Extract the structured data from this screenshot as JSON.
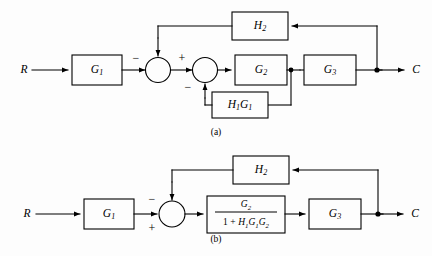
{
  "figure": {
    "type": "control-system-block-diagram",
    "background_color": "#fdfdfd",
    "line_color": "#000000",
    "captions": {
      "a": "(a)",
      "b": "(b)"
    }
  },
  "diagram_a": {
    "caption": "(a)",
    "input_label": "R",
    "output_label": "C",
    "blocks": [
      {
        "name": "G1",
        "base": "G",
        "sub": "1"
      },
      {
        "name": "G2",
        "base": "G",
        "sub": "2"
      },
      {
        "name": "G3",
        "base": "G",
        "sub": "3"
      },
      {
        "name": "H2",
        "base": "H",
        "sub": "2"
      },
      {
        "name": "H1G1",
        "base": "H",
        "sub": "1",
        "base2": "G",
        "sub2": "1"
      }
    ],
    "summing_junctions": [
      {
        "id": "sum1",
        "signs": {
          "left_input": "",
          "top_input": "−"
        },
        "sign_left_display": "−"
      },
      {
        "id": "sum2",
        "signs": {
          "left_input": "+",
          "bottom_input": "−"
        },
        "sign_left_display": "+",
        "sign_bottom_display": "−"
      }
    ],
    "signals": {
      "outer_feedback": "H2",
      "inner_feedback": "H1G1"
    }
  },
  "diagram_b": {
    "caption": "(b)",
    "input_label": "R",
    "output_label": "C",
    "blocks": [
      {
        "name": "G1",
        "base": "G",
        "sub": "1"
      },
      {
        "name": "reduced-transfer-function",
        "numerator": {
          "base": "G",
          "sub": "2"
        },
        "denominator_text": "1 + H1G1G2",
        "denominator_parts": [
          {
            "text": "1",
            "style": "op"
          },
          {
            "text": "+",
            "style": "op"
          },
          {
            "base": "H",
            "sub": "1"
          },
          {
            "base": "G",
            "sub": "1"
          },
          {
            "base": "G",
            "sub": "2"
          }
        ]
      },
      {
        "name": "G3",
        "base": "G",
        "sub": "3"
      },
      {
        "name": "H2",
        "base": "H",
        "sub": "2"
      }
    ],
    "summing_junctions": [
      {
        "id": "sum1",
        "sign_top_left": "−",
        "sign_bottom_left": "+"
      }
    ],
    "signals": {
      "feedback": "H2"
    }
  },
  "labels": {
    "R": "R",
    "C": "C",
    "G": "G",
    "H": "H",
    "one": "1",
    "plus": "+",
    "minus": "−",
    "sub1": "1",
    "sub2": "2",
    "sub3": "3"
  }
}
